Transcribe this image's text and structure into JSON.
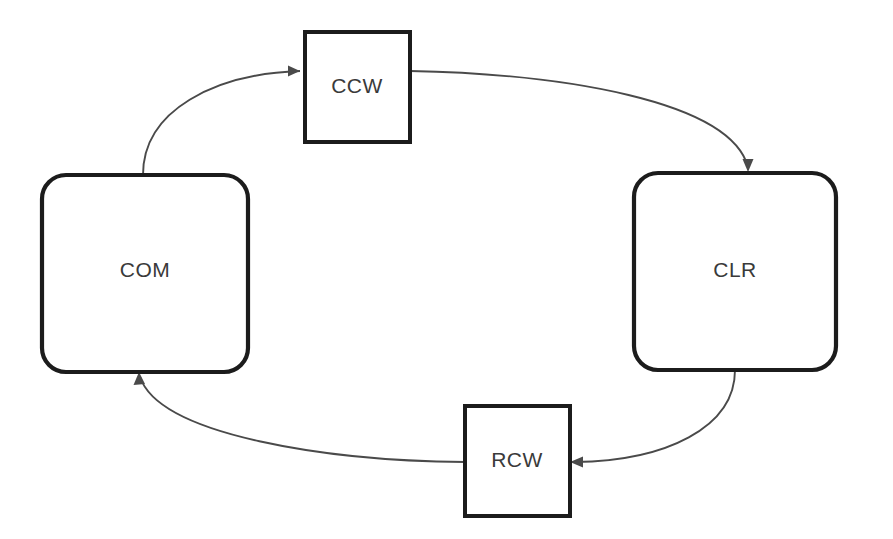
{
  "diagram": {
    "background_color": "#ffffff",
    "node_stroke_color": "#1c1c1c",
    "node_fill_color": "#ffffff",
    "edge_color": "#4a4a4a",
    "label_color": "#3a3a3a",
    "nodes": [
      {
        "id": "com",
        "label": "COM",
        "shape": "rounded-rectangle",
        "x": 42,
        "y": 175,
        "width": 206,
        "height": 197,
        "corner_radius": 24,
        "label_x": 145,
        "label_y": 271
      },
      {
        "id": "ccw",
        "label": "CCW",
        "shape": "rectangle",
        "x": 305,
        "y": 32,
        "width": 105,
        "height": 110,
        "corner_radius": 0,
        "label_x": 357,
        "label_y": 87
      },
      {
        "id": "clr",
        "label": "CLR",
        "shape": "rounded-rectangle",
        "x": 634,
        "y": 173,
        "width": 202,
        "height": 197,
        "corner_radius": 24,
        "label_x": 735,
        "label_y": 271
      },
      {
        "id": "rcw",
        "label": "RCW",
        "shape": "rectangle",
        "x": 465,
        "y": 406,
        "width": 105,
        "height": 110,
        "corner_radius": 0,
        "label_x": 517,
        "label_y": 461
      }
    ],
    "edges": [
      {
        "id": "com-to-ccw",
        "from": "com",
        "to": "ccw",
        "from_side": "top",
        "to_side": "left",
        "arrow_direction": "right",
        "path": "M 143 175 C 143 110 215 74 300 71",
        "head_points": "300,71 288,65.5 288,76.5"
      },
      {
        "id": "ccw-to-clr",
        "from": "ccw",
        "to": "clr",
        "from_side": "right",
        "to_side": "top",
        "arrow_direction": "down",
        "path": "M 410 71 C 560 74 730 100 748 167",
        "head_points": "748,172 742.5,159 753.5,159"
      },
      {
        "id": "clr-to-rcw",
        "from": "clr",
        "to": "rcw",
        "from_side": "bottom",
        "to_side": "right",
        "arrow_direction": "left",
        "path": "M 735 370 C 735 428 665 461 575 462",
        "head_points": "570,462 583,456.5 583,467.5"
      },
      {
        "id": "rcw-to-com",
        "from": "rcw",
        "to": "com",
        "from_side": "left",
        "to_side": "bottom",
        "arrow_direction": "up",
        "path": "M 465 462 C 330 461 160 436 140 377",
        "head_points": "139,372 133.5,385 145,384"
      }
    ]
  }
}
